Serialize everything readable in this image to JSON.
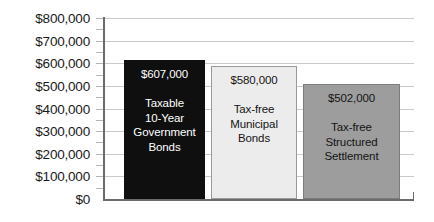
{
  "chart_data": {
    "type": "bar",
    "title": "",
    "xlabel": "",
    "ylabel": "",
    "ylim": [
      0,
      800000
    ],
    "ytick_step": 100000,
    "grid": true,
    "legend": "none",
    "categories": [
      "Taxable 10-Year Government Bonds",
      "Tax-free Municipal Bonds",
      "Tax-free Structured Settlement"
    ],
    "values": [
      607000,
      580000,
      502000
    ],
    "value_labels": [
      "$607,000",
      "$580,000",
      "$502,000"
    ],
    "ytick_labels": [
      "$800,000",
      "$700,000",
      "$600,000",
      "$500,000",
      "$400,000",
      "$300,000",
      "$200,000",
      "$100,000",
      "$0"
    ],
    "ytick_values": [
      800000,
      700000,
      600000,
      500000,
      400000,
      300000,
      200000,
      100000,
      0
    ],
    "bars": [
      {
        "name": "taxable-government-bonds",
        "value": 607000,
        "value_label": "$607,000",
        "label_line1": "Taxable",
        "label_line2": "10-Year",
        "label_line3": "Government",
        "label_line4": "Bonds",
        "fill": "#0f0f0f",
        "border": "#0f0f0f",
        "text_color": "#ffffff"
      },
      {
        "name": "tax-free-municipal-bonds",
        "value": 580000,
        "value_label": "$580,000",
        "label_line1": "Tax-free",
        "label_line2": "Municipal",
        "label_line3": "Bonds",
        "label_line4": "",
        "fill": "#ececec",
        "border": "#9a9a9a",
        "text_color": "#141414"
      },
      {
        "name": "tax-free-structured-settlement",
        "value": 502000,
        "value_label": "$502,000",
        "label_line1": "Tax-free",
        "label_line2": "Structured",
        "label_line3": "Settlement",
        "label_line4": "",
        "fill": "#9d9d9d",
        "border": "#7c7c7c",
        "text_color": "#141414"
      }
    ],
    "colors": {
      "background": "#ffffff",
      "axis": "#6b6b6b",
      "gridline": "#c9c9c9",
      "tick": "#b5b5b5",
      "axis_text": "#1a1a1a"
    }
  }
}
